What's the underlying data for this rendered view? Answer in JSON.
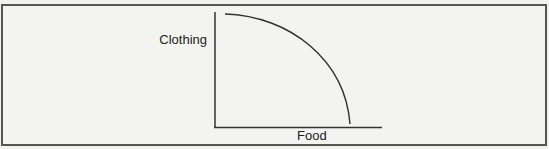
{
  "diagram": {
    "type": "production-possibilities-frontier",
    "y_axis_label": "Clothing",
    "x_axis_label": "Food",
    "curve": "concave (bowed-outward) curve from top of y-axis down to x-axis",
    "colors": {
      "background": "#f3f3f1",
      "frame_border": "#555555",
      "axis": "#333333",
      "curve": "#333333",
      "text": "#222222"
    }
  }
}
